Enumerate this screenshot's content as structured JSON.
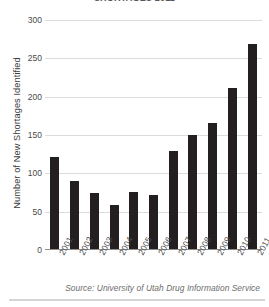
{
  "chart_data": {
    "type": "bar",
    "title": "SHORTAGES 2011",
    "categories": [
      "2001",
      "2002",
      "2003",
      "2004",
      "2005",
      "2006",
      "2007",
      "2008",
      "2009",
      "2010",
      "2011"
    ],
    "values": [
      120,
      89,
      73,
      58,
      74,
      70,
      128,
      149,
      165,
      210,
      267
    ],
    "xlabel": "",
    "ylabel": "Number of New Shortages Identified",
    "ylim": [
      0,
      300
    ],
    "yticks": [
      0,
      50,
      100,
      150,
      200,
      250,
      300
    ],
    "ytick_labels": [
      "0",
      "50",
      "100",
      "150",
      "200",
      "250",
      "300"
    ],
    "grid": true,
    "legend": "none",
    "bar_color": "#231f20",
    "grid_color": "#dcdcdc",
    "axis_color": "#8c8c8c",
    "source_note": "Source: University of Utah Drug Information Service"
  }
}
